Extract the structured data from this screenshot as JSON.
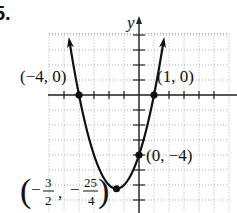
{
  "problem_number": "5.",
  "chart_data": {
    "type": "line",
    "title": "",
    "function": "y = x^2 + 3x - 4",
    "xlabel": "",
    "ylabel": "y",
    "xlim": [
      -6,
      6
    ],
    "ylim": [
      -7.9,
      4.1
    ],
    "grid": true,
    "grid_step": 1,
    "tick_step": 1,
    "series": [
      {
        "name": "parabola",
        "x": [
          -4.7,
          -4.5,
          -4,
          -3.5,
          -3,
          -2.5,
          -2,
          -1.5,
          -1,
          -0.5,
          0,
          0.5,
          1,
          1.5,
          1.7
        ],
        "values": [
          3.99,
          2.75,
          0,
          -2.25,
          -4,
          -5.25,
          -6,
          -6.25,
          -6,
          -5.25,
          -4,
          -2.25,
          0,
          2.75,
          4.19
        ]
      }
    ],
    "annotations": [
      {
        "point": [
          -4,
          0
        ],
        "label": "(−4, 0)"
      },
      {
        "point": [
          1,
          0
        ],
        "label": "(1, 0)"
      },
      {
        "point": [
          0,
          -4
        ],
        "label": "(0, −4)"
      },
      {
        "point": [
          -1.5,
          -6.25
        ],
        "label": "(−3/2, −25/4)",
        "num1": "3",
        "den1": "2",
        "num2": "25",
        "den2": "4"
      }
    ]
  },
  "labels": {
    "y_axis": "y",
    "x_int_left": "(−4, 0)",
    "x_int_right": "(1, 0)",
    "y_int": "(0, −4)",
    "vertex_open": "(",
    "vertex_minus": "−",
    "vertex_n1": "3",
    "vertex_d1": "2",
    "vertex_comma": ",",
    "vertex_n2": "25",
    "vertex_d2": "4",
    "vertex_close": ")"
  }
}
